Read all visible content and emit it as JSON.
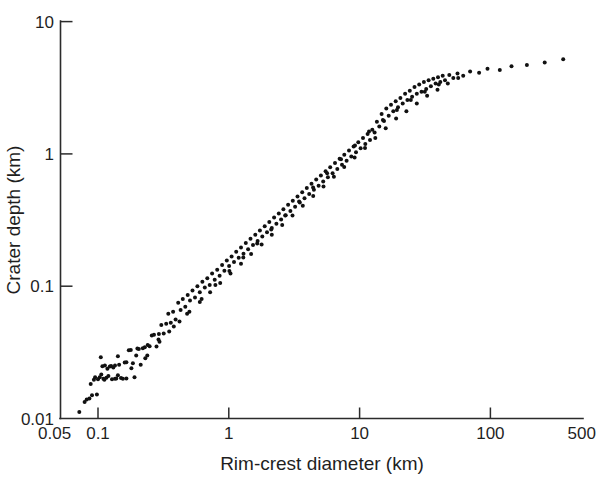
{
  "figure": {
    "background_color": "#ffffff",
    "ink_color": "#111111"
  },
  "chart_data": {
    "type": "scatter",
    "title": "",
    "xlabel": "Rim-crest diameter (km)",
    "ylabel": "Crater depth (km)",
    "xscale": "log",
    "yscale": "log",
    "xlim": [
      0.05,
      500
    ],
    "ylim": [
      0.01,
      10
    ],
    "grid": false,
    "legend": null,
    "marker": {
      "shape": "circle",
      "size_px": 4,
      "color": "#111111",
      "filled": true
    },
    "xticks": [
      0.05,
      0.1,
      1,
      10,
      100,
      500
    ],
    "xticklabels": [
      "0.05",
      "0.1",
      "1",
      "10",
      "100",
      "500"
    ],
    "yticks": [
      0.01,
      0.1,
      1,
      10
    ],
    "yticklabels": [
      "0.01",
      "0.1",
      "1",
      "10"
    ],
    "annotations": [],
    "series": [
      {
        "name": "craters",
        "points": [
          [
            0.072,
            0.0112
          ],
          [
            0.079,
            0.0133
          ],
          [
            0.082,
            0.0139
          ],
          [
            0.086,
            0.0142
          ],
          [
            0.09,
            0.015
          ],
          [
            0.093,
            0.0196
          ],
          [
            0.095,
            0.0205
          ],
          [
            0.098,
            0.0152
          ],
          [
            0.1,
            0.0198
          ],
          [
            0.103,
            0.0205
          ],
          [
            0.106,
            0.0215
          ],
          [
            0.108,
            0.0248
          ],
          [
            0.11,
            0.02
          ],
          [
            0.113,
            0.0252
          ],
          [
            0.116,
            0.0203
          ],
          [
            0.118,
            0.0238
          ],
          [
            0.12,
            0.021
          ],
          [
            0.123,
            0.0247
          ],
          [
            0.126,
            0.025
          ],
          [
            0.128,
            0.0198
          ],
          [
            0.131,
            0.0243
          ],
          [
            0.135,
            0.02
          ],
          [
            0.138,
            0.0201
          ],
          [
            0.142,
            0.0295
          ],
          [
            0.145,
            0.0255
          ],
          [
            0.15,
            0.0202
          ],
          [
            0.155,
            0.02
          ],
          [
            0.16,
            0.0265
          ],
          [
            0.165,
            0.0201
          ],
          [
            0.172,
            0.0328
          ],
          [
            0.178,
            0.033
          ],
          [
            0.185,
            0.0262
          ],
          [
            0.19,
            0.0205
          ],
          [
            0.196,
            0.03
          ],
          [
            0.205,
            0.0335
          ],
          [
            0.212,
            0.0255
          ],
          [
            0.22,
            0.034
          ],
          [
            0.228,
            0.0345
          ],
          [
            0.238,
            0.03
          ],
          [
            0.248,
            0.0352
          ],
          [
            0.258,
            0.0425
          ],
          [
            0.268,
            0.043
          ],
          [
            0.28,
            0.035
          ],
          [
            0.292,
            0.0435
          ],
          [
            0.305,
            0.051
          ],
          [
            0.318,
            0.044
          ],
          [
            0.332,
            0.052
          ],
          [
            0.345,
            0.062
          ],
          [
            0.36,
            0.053
          ],
          [
            0.375,
            0.064
          ],
          [
            0.392,
            0.056
          ],
          [
            0.41,
            0.075
          ],
          [
            0.428,
            0.066
          ],
          [
            0.445,
            0.08
          ],
          [
            0.465,
            0.07
          ],
          [
            0.485,
            0.086
          ],
          [
            0.505,
            0.078
          ],
          [
            0.528,
            0.093
          ],
          [
            0.552,
            0.082
          ],
          [
            0.575,
            0.1
          ],
          [
            0.6,
            0.09
          ],
          [
            0.628,
            0.108
          ],
          [
            0.655,
            0.098
          ],
          [
            0.685,
            0.115
          ],
          [
            0.715,
            0.102
          ],
          [
            0.745,
            0.125
          ],
          [
            0.78,
            0.112
          ],
          [
            0.815,
            0.133
          ],
          [
            0.85,
            0.12
          ],
          [
            0.888,
            0.145
          ],
          [
            0.925,
            0.131
          ],
          [
            0.965,
            0.156
          ],
          [
            1.005,
            0.142
          ],
          [
            1.05,
            0.168
          ],
          [
            1.095,
            0.152
          ],
          [
            1.14,
            0.182
          ],
          [
            1.19,
            0.164
          ],
          [
            1.24,
            0.196
          ],
          [
            1.295,
            0.176
          ],
          [
            1.35,
            0.212
          ],
          [
            1.405,
            0.19
          ],
          [
            1.465,
            0.228
          ],
          [
            1.53,
            0.205
          ],
          [
            1.595,
            0.245
          ],
          [
            1.66,
            0.22
          ],
          [
            1.73,
            0.264
          ],
          [
            1.805,
            0.238
          ],
          [
            1.88,
            0.284
          ],
          [
            1.96,
            0.256
          ],
          [
            2.04,
            0.306
          ],
          [
            2.13,
            0.276
          ],
          [
            2.22,
            0.33
          ],
          [
            2.31,
            0.296
          ],
          [
            2.41,
            0.355
          ],
          [
            2.51,
            0.32
          ],
          [
            2.615,
            0.382
          ],
          [
            2.725,
            0.344
          ],
          [
            2.84,
            0.412
          ],
          [
            2.96,
            0.37
          ],
          [
            3.085,
            0.443
          ],
          [
            3.215,
            0.398
          ],
          [
            3.35,
            0.477
          ],
          [
            3.49,
            0.429
          ],
          [
            3.64,
            0.513
          ],
          [
            3.79,
            0.462
          ],
          [
            3.95,
            0.552
          ],
          [
            4.115,
            0.497
          ],
          [
            4.29,
            0.594
          ],
          [
            4.47,
            0.535
          ],
          [
            4.66,
            0.639
          ],
          [
            4.855,
            0.575
          ],
          [
            5.06,
            0.687
          ],
          [
            5.27,
            0.619
          ],
          [
            5.495,
            0.739
          ],
          [
            5.725,
            0.665
          ],
          [
            5.965,
            0.794
          ],
          [
            6.215,
            0.715
          ],
          [
            6.48,
            0.854
          ],
          [
            6.75,
            0.769
          ],
          [
            7.035,
            0.918
          ],
          [
            7.33,
            0.827
          ],
          [
            7.64,
            0.986
          ],
          [
            7.96,
            0.889
          ],
          [
            8.295,
            1.06
          ],
          [
            8.64,
            0.956
          ],
          [
            9.005,
            1.14
          ],
          [
            9.385,
            1.028
          ],
          [
            9.775,
            1.226
          ],
          [
            10.18,
            1.105
          ],
          [
            10.61,
            1.317
          ],
          [
            11.05,
            1.187
          ],
          [
            11.52,
            1.414
          ],
          [
            12.0,
            1.275
          ],
          [
            12.5,
            1.52
          ],
          [
            13.03,
            1.45
          ],
          [
            13.57,
            1.75
          ],
          [
            14.14,
            1.61
          ],
          [
            14.74,
            2.0
          ],
          [
            15.36,
            1.77
          ],
          [
            16.0,
            2.2
          ],
          [
            16.68,
            1.94
          ],
          [
            17.38,
            2.35
          ],
          [
            18.11,
            2.1
          ],
          [
            18.88,
            2.5
          ],
          [
            19.67,
            2.25
          ],
          [
            20.5,
            2.65
          ],
          [
            21.37,
            2.4
          ],
          [
            22.27,
            2.85
          ],
          [
            23.2,
            2.55
          ],
          [
            24.19,
            3.0
          ],
          [
            25.2,
            2.7
          ],
          [
            26.27,
            3.2
          ],
          [
            27.38,
            2.85
          ],
          [
            28.53,
            3.35
          ],
          [
            29.74,
            2.95
          ],
          [
            31.0,
            3.5
          ],
          [
            32.3,
            3.1
          ],
          [
            33.67,
            3.6
          ],
          [
            35.1,
            3.25
          ],
          [
            36.58,
            3.7
          ],
          [
            38.13,
            3.4
          ],
          [
            39.74,
            3.8
          ],
          [
            41.42,
            3.5
          ],
          [
            43.18,
            3.9
          ],
          [
            45.0,
            3.6
          ],
          [
            48.5,
            3.95
          ],
          [
            52.0,
            3.75
          ],
          [
            56.0,
            4.05
          ],
          [
            62.0,
            3.9
          ],
          [
            70.0,
            4.2
          ],
          [
            82.0,
            4.1
          ],
          [
            95.0,
            4.4
          ],
          [
            118.0,
            4.3
          ],
          [
            145.0,
            4.6
          ],
          [
            190.0,
            4.7
          ],
          [
            260.0,
            4.9
          ],
          [
            360.0,
            5.2
          ],
          [
            0.105,
            0.029
          ],
          [
            0.135,
            0.0252
          ],
          [
            0.165,
            0.0266
          ],
          [
            0.2,
            0.0338
          ],
          [
            0.24,
            0.036
          ],
          [
            0.29,
            0.0395
          ],
          [
            0.35,
            0.0455
          ],
          [
            0.42,
            0.054
          ],
          [
            0.5,
            0.064
          ],
          [
            0.6,
            0.076
          ],
          [
            0.72,
            0.09
          ],
          [
            0.86,
            0.106
          ],
          [
            1.03,
            0.125
          ],
          [
            1.24,
            0.148
          ],
          [
            1.48,
            0.175
          ],
          [
            1.78,
            0.207
          ],
          [
            2.13,
            0.245
          ],
          [
            2.56,
            0.29
          ],
          [
            3.07,
            0.343
          ],
          [
            3.68,
            0.406
          ],
          [
            4.42,
            0.48
          ],
          [
            5.3,
            0.568
          ],
          [
            6.36,
            0.672
          ],
          [
            7.63,
            0.795
          ],
          [
            9.16,
            0.94
          ],
          [
            10.99,
            1.11
          ],
          [
            13.19,
            1.32
          ],
          [
            15.83,
            1.56
          ],
          [
            19.0,
            1.85
          ],
          [
            22.8,
            2.1
          ],
          [
            27.35,
            2.4
          ],
          [
            32.82,
            2.75
          ],
          [
            39.39,
            3.05
          ],
          [
            47.27,
            3.4
          ],
          [
            56.72,
            3.75
          ],
          [
            0.088,
            0.0182
          ],
          [
            0.112,
            0.0196
          ],
          [
            0.142,
            0.0212
          ],
          [
            0.18,
            0.024
          ],
          [
            0.23,
            0.0285
          ],
          [
            0.295,
            0.038
          ],
          [
            0.38,
            0.0495
          ],
          [
            0.48,
            0.062
          ],
          [
            0.62,
            0.08
          ],
          [
            0.79,
            0.102
          ],
          [
            1.01,
            0.13
          ],
          [
            1.29,
            0.165
          ],
          [
            1.65,
            0.21
          ],
          [
            2.11,
            0.268
          ],
          [
            2.7,
            0.342
          ],
          [
            3.45,
            0.437
          ],
          [
            4.41,
            0.558
          ],
          [
            5.64,
            0.713
          ],
          [
            7.21,
            0.91
          ],
          [
            9.22,
            1.16
          ],
          [
            11.79,
            1.48
          ],
          [
            15.08,
            1.8
          ],
          [
            19.28,
            2.15
          ],
          [
            24.65,
            2.55
          ],
          [
            31.52,
            2.95
          ],
          [
            40.3,
            3.35
          ]
        ]
      }
    ]
  },
  "axes": {
    "x_title": "Rim-crest diameter (km)",
    "y_title": "Crater depth (km)"
  }
}
